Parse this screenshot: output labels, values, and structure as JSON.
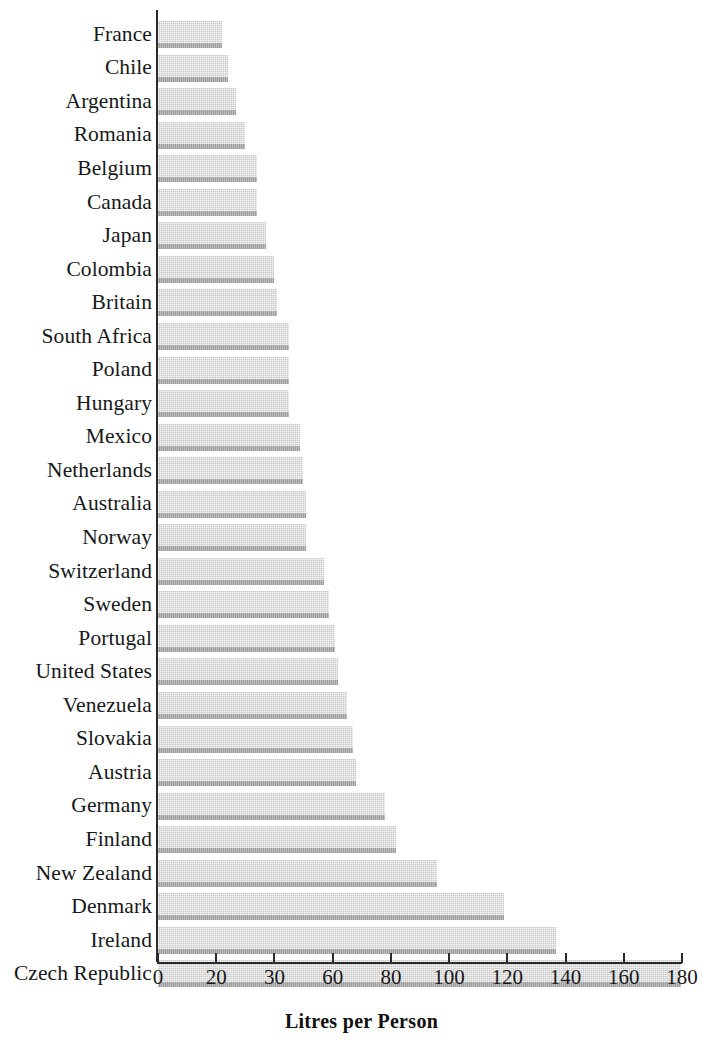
{
  "chart_data": {
    "type": "bar",
    "orientation": "horizontal",
    "title": "",
    "xlabel": "Litres per Person",
    "ylabel": "",
    "xlim": [
      0,
      180
    ],
    "grid": false,
    "legend": null,
    "xticks": [
      "0",
      "20",
      "30",
      "60",
      "80",
      "100",
      "120",
      "140",
      "160",
      "180"
    ],
    "categories": [
      "France",
      "Chile",
      "Argentina",
      "Romania",
      "Belgium",
      "Canada",
      "Japan",
      "Colombia",
      "Britain",
      "South Africa",
      "Poland",
      "Hungary",
      "Mexico",
      "Netherlands",
      "Australia",
      "Norway",
      "Switzerland",
      "Sweden",
      "Portugal",
      "United States",
      "Venezuela",
      "Slovakia",
      "Austria",
      "Germany",
      "Finland",
      "New Zealand",
      "Denmark",
      "Ireland",
      "Czech Republic"
    ],
    "values": [
      22,
      24,
      27,
      30,
      34,
      34,
      37,
      40,
      41,
      45,
      45,
      45,
      49,
      50,
      51,
      51,
      57,
      59,
      61,
      62,
      65,
      67,
      68,
      78,
      82,
      96,
      119,
      137,
      180
    ]
  },
  "style": {
    "bar_fill": "#c8c8c8",
    "bar_shadow": "#9c9c9c",
    "axis_color": "#2b2b2b",
    "text_color": "#17181a",
    "background": "#ffffff"
  }
}
